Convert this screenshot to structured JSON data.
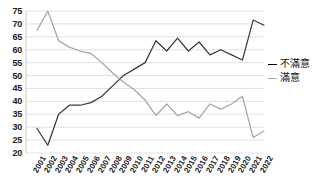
{
  "chart_data": {
    "type": "line",
    "title": "",
    "xlabel": "",
    "ylabel": "",
    "ylim": [
      20,
      75
    ],
    "ytick_step": 5,
    "yticks": [
      20,
      25,
      30,
      35,
      40,
      45,
      50,
      55,
      60,
      65,
      70,
      75
    ],
    "grid": true,
    "legend_position": "right",
    "categories": [
      "2001",
      "2002",
      "2003",
      "2004",
      "2005",
      "2006",
      "2007",
      "2008",
      "2009",
      "2010",
      "2011",
      "2012",
      "2013",
      "2014",
      "2015",
      "2016",
      "2017",
      "2018",
      "2019",
      "2020",
      "2021",
      "2022"
    ],
    "series": [
      {
        "name": "不滿意",
        "color": "#3b3b3b",
        "values": [
          29.5,
          23.0,
          35.0,
          38.5,
          38.5,
          39.5,
          42.0,
          46.0,
          50.0,
          52.5,
          55.0,
          63.5,
          59.5,
          64.5,
          59.5,
          63.0,
          58.0,
          60.0,
          58.0,
          56.0,
          71.5,
          69.5
        ]
      },
      {
        "name": "滿意",
        "color": "#a6a6a6",
        "values": [
          67.5,
          75.0,
          63.5,
          61.0,
          59.5,
          58.5,
          55.0,
          51.0,
          47.5,
          44.5,
          40.5,
          34.5,
          39.0,
          34.5,
          36.0,
          33.5,
          39.0,
          37.0,
          39.0,
          42.0,
          26.0,
          28.5
        ]
      }
    ]
  },
  "legend": {
    "items": [
      {
        "label": "不滿意",
        "marker": "dash-dark"
      },
      {
        "label": "滿意",
        "marker": "dash-light"
      }
    ]
  },
  "colors": {
    "grid": "#d9d9d9",
    "axis": "#bfbfbf",
    "series_dark": "#3b3b3b",
    "series_light": "#a6a6a6",
    "text": "#222222",
    "background": "#ffffff"
  }
}
